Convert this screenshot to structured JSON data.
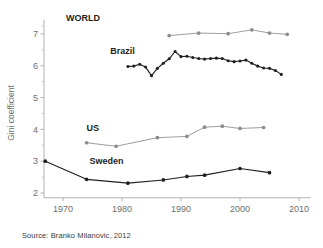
{
  "chart_data": {
    "type": "line",
    "title": "",
    "xlabel": "",
    "ylabel": "Gini coefficient",
    "xlim": [
      1966,
      2012
    ],
    "ylim": [
      1.85,
      7.45
    ],
    "grid": false,
    "legend_position": "inline-labels",
    "x_ticks": [
      1970,
      1980,
      1990,
      2000,
      2010
    ],
    "y_ticks": [
      2,
      3,
      4,
      5,
      6,
      7
    ],
    "y_minor_ticks": [
      2.5,
      3.5,
      4.5,
      5.5,
      6.5,
      7.25
    ],
    "source": "Source: Branko Milanovic, 2012",
    "series": [
      {
        "name": "WORLD",
        "color": "#8c8c8c",
        "label_x": 1970.5,
        "label_y": 7.42,
        "points": [
          {
            "x": 1988,
            "y": 6.95
          },
          {
            "x": 1993,
            "y": 7.03
          },
          {
            "x": 1998,
            "y": 7.01
          },
          {
            "x": 2002,
            "y": 7.13
          },
          {
            "x": 2005,
            "y": 7.03
          },
          {
            "x": 2008,
            "y": 6.99
          }
        ]
      },
      {
        "name": "Brazil",
        "color": "#231f20",
        "label_x": 1978.0,
        "label_y": 6.38,
        "points": [
          {
            "x": 1981,
            "y": 5.98
          },
          {
            "x": 1982,
            "y": 5.99
          },
          {
            "x": 1983,
            "y": 6.05
          },
          {
            "x": 1984,
            "y": 5.96
          },
          {
            "x": 1985,
            "y": 5.69
          },
          {
            "x": 1986,
            "y": 5.92
          },
          {
            "x": 1987,
            "y": 6.08
          },
          {
            "x": 1988,
            "y": 6.22
          },
          {
            "x": 1989,
            "y": 6.45
          },
          {
            "x": 1990,
            "y": 6.29
          },
          {
            "x": 1991,
            "y": 6.3
          },
          {
            "x": 1992,
            "y": 6.26
          },
          {
            "x": 1993,
            "y": 6.23
          },
          {
            "x": 1994,
            "y": 6.21
          },
          {
            "x": 1995,
            "y": 6.23
          },
          {
            "x": 1996,
            "y": 6.24
          },
          {
            "x": 1997,
            "y": 6.23
          },
          {
            "x": 1998,
            "y": 6.16
          },
          {
            "x": 1999,
            "y": 6.13
          },
          {
            "x": 2000,
            "y": 6.15
          },
          {
            "x": 2001,
            "y": 6.18
          },
          {
            "x": 2002,
            "y": 6.08
          },
          {
            "x": 2003,
            "y": 5.99
          },
          {
            "x": 2004,
            "y": 5.93
          },
          {
            "x": 2005,
            "y": 5.92
          },
          {
            "x": 2006,
            "y": 5.85
          },
          {
            "x": 2007,
            "y": 5.73
          }
        ]
      },
      {
        "name": "US",
        "color": "#8c8c8c",
        "label_x": 1974.0,
        "label_y": 3.94,
        "points": [
          {
            "x": 1974,
            "y": 3.58
          },
          {
            "x": 1979,
            "y": 3.47
          },
          {
            "x": 1986,
            "y": 3.74
          },
          {
            "x": 1991,
            "y": 3.78
          },
          {
            "x": 1994,
            "y": 4.07
          },
          {
            "x": 1997,
            "y": 4.1
          },
          {
            "x": 2000,
            "y": 4.03
          },
          {
            "x": 2004,
            "y": 4.06
          }
        ]
      },
      {
        "name": "Sweden",
        "color": "#231f20",
        "label_x": 1974.5,
        "label_y": 2.92,
        "points": [
          {
            "x": 1967,
            "y": 3.0
          },
          {
            "x": 1974,
            "y": 2.43
          },
          {
            "x": 1981,
            "y": 2.31
          },
          {
            "x": 1987,
            "y": 2.41
          },
          {
            "x": 1991,
            "y": 2.52
          },
          {
            "x": 1994,
            "y": 2.56
          },
          {
            "x": 2000,
            "y": 2.77
          },
          {
            "x": 2005,
            "y": 2.64
          }
        ]
      }
    ]
  }
}
